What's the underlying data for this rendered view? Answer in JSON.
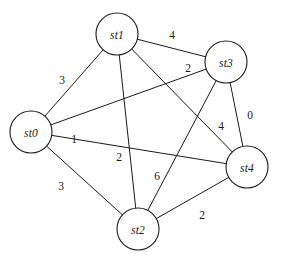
{
  "figure": {
    "kind": "weighted-undirected-graph",
    "background_color": "#ffffff",
    "stroke_color": "#1a1a1a",
    "width": 283,
    "height": 262
  },
  "graph": {
    "node_radius": 21,
    "nodes": [
      {
        "id": "st0",
        "label": "st0",
        "cx": 31,
        "cy": 132
      },
      {
        "id": "st1",
        "label": "st1",
        "cx": 117,
        "cy": 34
      },
      {
        "id": "st2",
        "label": "st2",
        "cx": 138,
        "cy": 229
      },
      {
        "id": "st3",
        "label": "st3",
        "cx": 226,
        "cy": 62
      },
      {
        "id": "st4",
        "label": "st4",
        "cx": 247,
        "cy": 167
      }
    ],
    "edges": [
      {
        "id": "e-st0-st1",
        "source": "st0",
        "target": "st1",
        "weight": "3",
        "label_x": 62,
        "label_y": 80
      },
      {
        "id": "e-st1-st3",
        "source": "st1",
        "target": "st3",
        "weight": "4",
        "label_x": 172,
        "label_y": 35
      },
      {
        "id": "e-st0-st3",
        "source": "st0",
        "target": "st3",
        "weight": "2",
        "label_x": 188,
        "label_y": 68
      },
      {
        "id": "e-st3-st4",
        "source": "st3",
        "target": "st4",
        "weight": "0",
        "label_x": 250,
        "label_y": 115
      },
      {
        "id": "e-st2-st3",
        "source": "st2",
        "target": "st3",
        "weight": "4",
        "label_x": 221,
        "label_y": 126
      },
      {
        "id": "e-st0-st4",
        "source": "st0",
        "target": "st4",
        "weight": "1",
        "label_x": 74,
        "label_y": 139
      },
      {
        "id": "e-st1-st2",
        "source": "st1",
        "target": "st2",
        "weight": "2",
        "label_x": 119,
        "label_y": 157
      },
      {
        "id": "e-st1-st4",
        "source": "st1",
        "target": "st4",
        "weight": "6",
        "label_x": 157,
        "label_y": 176
      },
      {
        "id": "e-st0-st2",
        "source": "st0",
        "target": "st2",
        "weight": "3",
        "label_x": 61,
        "label_y": 186
      },
      {
        "id": "e-st2-st4",
        "source": "st2",
        "target": "st4",
        "weight": "2",
        "label_x": 202,
        "label_y": 215
      }
    ]
  }
}
